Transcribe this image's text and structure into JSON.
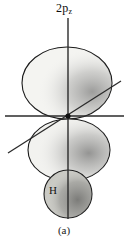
{
  "figure": {
    "caption": "(a)",
    "orbital_label_main": "2p",
    "orbital_label_sub": "z",
    "atom_label": "H",
    "background_color": "#ffffff",
    "outline_color": "#1a1a1a",
    "lobe_fill_color": "#f2f2ef",
    "atom_fill_color": "#c9c9c4",
    "stipple_color": "#3a3a3a",
    "axis_color": "#2b2b2b",
    "node_color": "#111111"
  },
  "elements": {
    "upper_lobe_name": "upper p-orbital lobe",
    "lower_lobe_name": "lower p-orbital lobe",
    "hydrogen_atom_name": "hydrogen 1s atom",
    "vertical_axis_name": "z axis",
    "horizontal_axis_name": "x axis",
    "diagonal_axis_name": "y axis",
    "node_name": "nodal origin"
  }
}
